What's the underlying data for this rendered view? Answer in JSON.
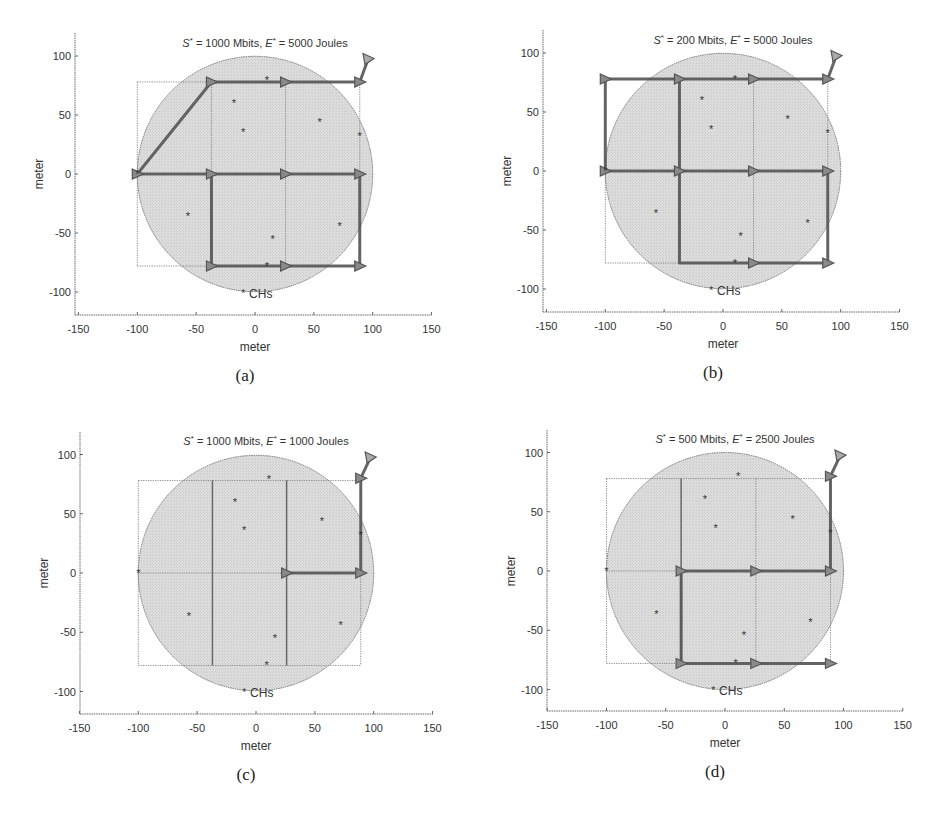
{
  "figure": {
    "axis_label": "meter",
    "legend_label": "CHs",
    "colors": {
      "circle_fill": "#d9d9d9",
      "circle_edge": "#777777",
      "grid": "#888888",
      "path": "#555555",
      "marker": "#666666",
      "axis": "#666666"
    }
  },
  "chart_data": [
    {
      "type": "scatter",
      "panel": "a",
      "caption": "(a)",
      "title": "S* = 1000 Mbits,  E* = 5000 Joules",
      "title_parts": {
        "s_val": " = 1000 Mbits,  ",
        "e_val": " = 5000 Joules"
      },
      "xlabel": "meter",
      "ylabel": "meter",
      "xlim": [
        -150,
        150
      ],
      "ylim": [
        -120,
        120
      ],
      "xticks": [
        -150,
        -100,
        -50,
        0,
        50,
        100,
        150
      ],
      "yticks": [
        -100,
        -50,
        0,
        50,
        100
      ],
      "legend": "CHs",
      "field_circle": {
        "cx": 0,
        "cy": 0,
        "r": 100
      },
      "grid_x": [
        -100,
        -37,
        26,
        89
      ],
      "grid_y": [
        -78,
        0,
        78
      ],
      "ch_points": [
        [
          -18,
          60
        ],
        [
          -10,
          36
        ],
        [
          55,
          44
        ],
        [
          89,
          32
        ],
        [
          -57,
          -36
        ],
        [
          15,
          -55
        ],
        [
          72,
          -44
        ],
        [
          10,
          80
        ],
        [
          10,
          -78
        ],
        [
          -100,
          0
        ]
      ],
      "sink": [
        96,
        97
      ],
      "path": [
        [
          96,
          97
        ],
        [
          89,
          78
        ],
        [
          26,
          78
        ],
        [
          -37,
          78
        ],
        [
          -100,
          0
        ],
        [
          -37,
          0
        ],
        [
          26,
          0
        ],
        [
          89,
          0
        ],
        [
          89,
          -78
        ],
        [
          26,
          -78
        ],
        [
          -37,
          -78
        ],
        [
          -37,
          0
        ]
      ],
      "path_nodes": [
        [
          89,
          78
        ],
        [
          26,
          78
        ],
        [
          -37,
          78
        ],
        [
          -100,
          0
        ],
        [
          -37,
          0
        ],
        [
          26,
          0
        ],
        [
          89,
          0
        ],
        [
          89,
          -78
        ],
        [
          26,
          -78
        ],
        [
          -37,
          -78
        ]
      ]
    },
    {
      "type": "scatter",
      "panel": "b",
      "caption": "(b)",
      "title": "S* = 200 Mbits,  E* = 5000 Joules",
      "title_parts": {
        "s_val": " = 200 Mbits,  ",
        "e_val": " = 5000 Joules"
      },
      "xlabel": "meter",
      "ylabel": "meter",
      "xlim": [
        -150,
        150
      ],
      "ylim": [
        -120,
        120
      ],
      "xticks": [
        -150,
        -100,
        -50,
        0,
        50,
        100,
        150
      ],
      "yticks": [
        -100,
        -50,
        0,
        50,
        100
      ],
      "legend": "CHs",
      "field_circle": {
        "cx": 0,
        "cy": 0,
        "r": 100
      },
      "grid_x": [
        -100,
        -37,
        26,
        89
      ],
      "grid_y": [
        -78,
        0,
        78
      ],
      "ch_points": [
        [
          -18,
          60
        ],
        [
          -10,
          36
        ],
        [
          55,
          44
        ],
        [
          89,
          32
        ],
        [
          -57,
          -36
        ],
        [
          15,
          -55
        ],
        [
          72,
          -44
        ],
        [
          10,
          78
        ],
        [
          10,
          -78
        ],
        [
          -100,
          0
        ]
      ],
      "sink": [
        96,
        97
      ],
      "path": [
        [
          96,
          97
        ],
        [
          89,
          78
        ],
        [
          26,
          78
        ],
        [
          -37,
          78
        ],
        [
          -100,
          78
        ],
        [
          -100,
          0
        ],
        [
          -37,
          0
        ],
        [
          26,
          0
        ],
        [
          89,
          0
        ],
        [
          89,
          -78
        ],
        [
          26,
          -78
        ],
        [
          -37,
          -78
        ],
        [
          -37,
          78
        ]
      ],
      "path_nodes": [
        [
          89,
          78
        ],
        [
          26,
          78
        ],
        [
          -37,
          78
        ],
        [
          -100,
          78
        ],
        [
          -100,
          0
        ],
        [
          -37,
          0
        ],
        [
          26,
          0
        ],
        [
          89,
          0
        ],
        [
          89,
          -78
        ],
        [
          26,
          -78
        ]
      ]
    },
    {
      "type": "scatter",
      "panel": "c",
      "caption": "(c)",
      "title": "S* = 1000 Mbits,  E* = 1000 Joules",
      "title_parts": {
        "s_val": " = 1000 Mbits,  ",
        "e_val": " = 1000 Joules"
      },
      "xlabel": "meter",
      "ylabel": "meter",
      "xlim": [
        -150,
        150
      ],
      "ylim": [
        -120,
        120
      ],
      "xticks": [
        -150,
        -100,
        -50,
        0,
        50,
        100,
        150
      ],
      "yticks": [
        -100,
        -50,
        0,
        50,
        100
      ],
      "legend": "CHs",
      "field_circle": {
        "cx": 0,
        "cy": 0,
        "r": 100
      },
      "grid_x": [
        -100,
        -37,
        26,
        89
      ],
      "grid_y": [
        -78,
        0,
        78
      ],
      "ch_points": [
        [
          -18,
          60
        ],
        [
          -10,
          36
        ],
        [
          56,
          44
        ],
        [
          89,
          32
        ],
        [
          -57,
          -36
        ],
        [
          16,
          -55
        ],
        [
          72,
          -44
        ],
        [
          11,
          79
        ],
        [
          9,
          -78
        ],
        [
          -100,
          0
        ]
      ],
      "sink": [
        97,
        97
      ],
      "path": [
        [
          97,
          97
        ],
        [
          89,
          80
        ],
        [
          89,
          0
        ],
        [
          26,
          0
        ]
      ],
      "path_nodes": [
        [
          89,
          80
        ],
        [
          89,
          0
        ],
        [
          26,
          0
        ]
      ],
      "solid_grid_x": [
        -37,
        26
      ]
    },
    {
      "type": "scatter",
      "panel": "d",
      "caption": "(d)",
      "title": "S* = 500 Mbits,  E* = 2500 Joules",
      "title_parts": {
        "s_val": " = 500 Mbits,  ",
        "e_val": " = 2500 Joules"
      },
      "xlabel": "meter",
      "ylabel": "meter",
      "xlim": [
        -150,
        150
      ],
      "ylim": [
        -120,
        120
      ],
      "xticks": [
        -150,
        -100,
        -50,
        0,
        50,
        100,
        150
      ],
      "yticks": [
        -100,
        -50,
        0,
        50,
        100
      ],
      "legend": "CHs",
      "field_circle": {
        "cx": 0,
        "cy": 0,
        "r": 100
      },
      "grid_x": [
        -100,
        -37,
        26,
        89
      ],
      "grid_y": [
        -78,
        0,
        78
      ],
      "ch_points": [
        [
          -17,
          61
        ],
        [
          -8,
          36
        ],
        [
          57,
          44
        ],
        [
          89,
          32
        ],
        [
          -58,
          -36
        ],
        [
          16,
          -54
        ],
        [
          72,
          -43
        ],
        [
          11,
          80
        ],
        [
          9,
          -78
        ],
        [
          -100,
          0
        ]
      ],
      "sink": [
        97,
        97
      ],
      "path": [
        [
          97,
          97
        ],
        [
          89,
          80
        ],
        [
          89,
          0
        ],
        [
          26,
          0
        ],
        [
          -37,
          0
        ],
        [
          -37,
          -78
        ],
        [
          26,
          -78
        ],
        [
          89,
          -78
        ]
      ],
      "path_nodes": [
        [
          89,
          80
        ],
        [
          89,
          0
        ],
        [
          26,
          0
        ],
        [
          -37,
          0
        ],
        [
          -37,
          -78
        ],
        [
          26,
          -78
        ],
        [
          89,
          -78
        ]
      ],
      "solid_grid_x": [
        -37
      ]
    }
  ],
  "layout": {
    "panels": [
      {
        "left": 75,
        "top": 33,
        "x0": 255,
        "y0": 174,
        "sx": 1.177,
        "sy": 1.18,
        "axis_y": 315,
        "axis_x_left": 75,
        "axis_x_right": 432
      },
      {
        "left": 543,
        "top": 30,
        "x0": 723,
        "y0": 171,
        "sx": 1.177,
        "sy": 1.18,
        "axis_y": 312,
        "axis_x_left": 543,
        "axis_x_right": 900
      },
      {
        "left": 80,
        "top": 432,
        "x0": 256,
        "y0": 573,
        "sx": 1.177,
        "sy": 1.185,
        "axis_y": 714,
        "axis_x_left": 80,
        "axis_x_right": 433
      },
      {
        "left": 547,
        "top": 430,
        "x0": 725,
        "y0": 571,
        "sx": 1.185,
        "sy": 1.185,
        "axis_y": 711,
        "axis_x_left": 547,
        "axis_x_right": 903
      }
    ]
  }
}
